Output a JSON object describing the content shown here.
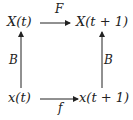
{
  "diagram": {
    "type": "commutative-square",
    "nodes": {
      "top_left": "X(t)",
      "top_right": "X(t + 1)",
      "bottom_left": "x(t)",
      "bottom_right": "x(t + 1)"
    },
    "arrows": {
      "top": {
        "label": "F",
        "from": "X(t)",
        "to": "X(t + 1)"
      },
      "bottom": {
        "label": "f",
        "from": "x(t)",
        "to": "x(t + 1)"
      },
      "left": {
        "label": "B",
        "from": "x(t)",
        "to": "X(t)"
      },
      "right": {
        "label": "B",
        "from": "x(t + 1)",
        "to": "X(t + 1)"
      }
    }
  }
}
